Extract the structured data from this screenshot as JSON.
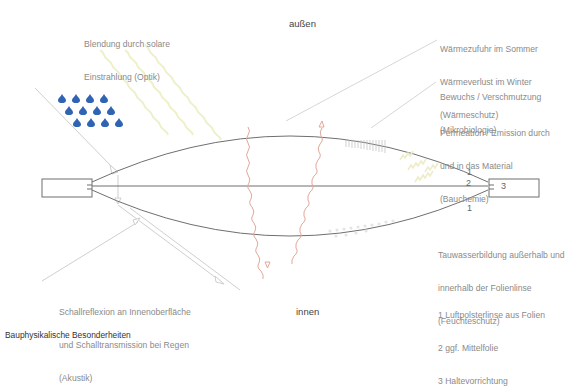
{
  "caption": "Bauphysikalische Besonderheiten",
  "zones": {
    "outside": "außen",
    "inside": "innen"
  },
  "annotations": {
    "optik": [
      "Blendung durch solare",
      "Einstrahlung (Optik)"
    ],
    "waermeschutz": [
      "Wärmezufuhr im Sommer",
      "Wärmeverlust im Winter",
      "(Wärmeschutz)"
    ],
    "mikrobiologie": [
      "Bewuchs / Verschmutzung",
      "(Mikrobiologie)"
    ],
    "bauchemie": [
      "Permeation / Emission durch",
      "und in das Material",
      "(Bauchemie)"
    ],
    "feuchteschutz": [
      "Tauwasserbildung außerhalb und",
      "innerhalb der Folienlinse",
      "(Feuchteschutz)"
    ],
    "akustik": [
      "Schallreflexion an Innenoberfläche",
      "und Schalltransmission bei Regen",
      "(Akustik)"
    ]
  },
  "legend": [
    "1 Luftpolsterlinse aus Folien",
    "2 ggf. Mittelfolie",
    "3 Haltevorrichtung"
  ],
  "part_numbers": {
    "top": "1",
    "middle": "2",
    "bottom": "1",
    "clamp": "3"
  },
  "colors": {
    "rain": "#2f63b3",
    "sun": "#eef0c8",
    "heat": "#e2a898",
    "line": "#777777",
    "leader": "#c8c8c8"
  }
}
